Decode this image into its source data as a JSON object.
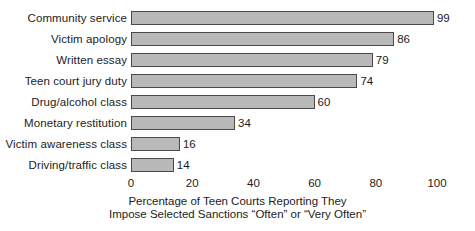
{
  "chart_data": {
    "type": "bar",
    "orientation": "horizontal",
    "title": "",
    "xlabel": "Percentage of Teen Courts Reporting They Impose Selected Sanctions “Often” or “Very Often”",
    "ylabel": "",
    "xlim": [
      0,
      100
    ],
    "xticks": [
      0,
      20,
      40,
      60,
      80,
      100
    ],
    "xtick_labels": [
      "0",
      "20",
      "40",
      "60",
      "80",
      "100"
    ],
    "grid": false,
    "legend": false,
    "bar_fill_color": "#b9b9b9",
    "bar_border_color": "#4a4a4a",
    "categories": [
      "Community service",
      "Victim apology",
      "Written essay",
      "Teen court jury duty",
      "Drug/alcohol class",
      "Monetary restitution",
      "Victim awareness class",
      "Driving/traffic class"
    ],
    "values": [
      99,
      86,
      79,
      74,
      60,
      34,
      16,
      14
    ],
    "value_labels": [
      "99",
      "86",
      "79",
      "74",
      "60",
      "34",
      "16",
      "14"
    ]
  },
  "caption": {
    "line1": "Percentage of Teen Courts Reporting They",
    "line2": "Impose Selected Sanctions “Often” or “Very Often”"
  }
}
